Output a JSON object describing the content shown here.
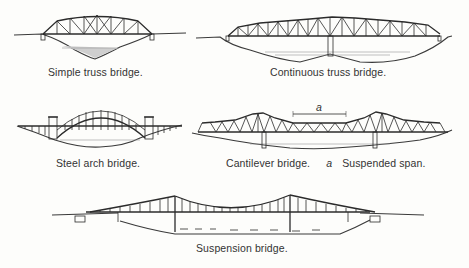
{
  "figures": [
    {
      "id": "simple-truss",
      "caption": "Simple truss bridge."
    },
    {
      "id": "continuous-truss",
      "caption": "Continuous truss bridge."
    },
    {
      "id": "steel-arch",
      "caption": "Steel arch bridge."
    },
    {
      "id": "cantilever",
      "caption": "Cantilever bridge.",
      "annotation_letter": "a",
      "annotation_text": "Suspended span.",
      "span_marker_label": "a"
    },
    {
      "id": "suspension",
      "caption": "Suspension bridge."
    }
  ]
}
